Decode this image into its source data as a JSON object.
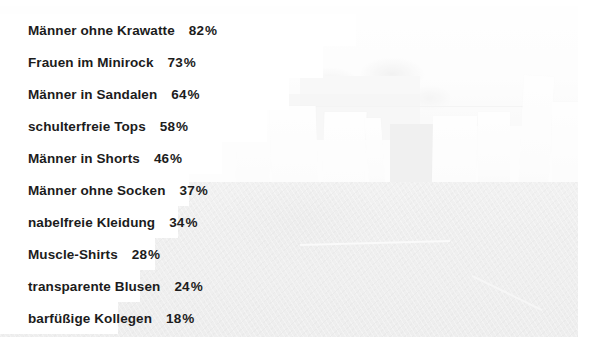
{
  "chart_data": {
    "type": "bar",
    "orientation": "horizontal",
    "title": "",
    "subtitle": "",
    "xlabel": "",
    "ylabel": "",
    "xlim": [
      0,
      100
    ],
    "grid": false,
    "legend": null,
    "value_suffix": "%",
    "categories": [
      "Männer ohne Krawatte",
      "Frauen im Minirock",
      "Männer in Sandalen",
      "schulterfreie Tops",
      "Männer in Shorts",
      "Männer ohne Socken",
      "nabelfreie Kleidung",
      "Muscle-Shirts",
      "transparente Blusen",
      "barfüßige Kollegen"
    ],
    "values": [
      82,
      73,
      64,
      58,
      46,
      37,
      34,
      28,
      24,
      18
    ]
  },
  "colors": {
    "bar": "#ffffff",
    "text": "#1c1c1c",
    "page_background": "#ffffff",
    "photo_tone": "#d9d9d9"
  },
  "rows": [
    {
      "label": "Männer ohne Krawatte",
      "value": "82",
      "pct": "%"
    },
    {
      "label": "Frauen im Minirock",
      "value": "73",
      "pct": "%"
    },
    {
      "label": "Männer in Sandalen",
      "value": "64",
      "pct": "%"
    },
    {
      "label": "schulterfreie Tops",
      "value": "58",
      "pct": "%"
    },
    {
      "label": "Männer in Shorts",
      "value": "46",
      "pct": "%"
    },
    {
      "label": "Männer ohne Socken",
      "value": "37",
      "pct": "%"
    },
    {
      "label": "nabelfreie Kleidung",
      "value": "34",
      "pct": "%"
    },
    {
      "label": "Muscle-Shirts",
      "value": "28",
      "pct": "%"
    },
    {
      "label": "transparente Blusen",
      "value": "24",
      "pct": "%"
    },
    {
      "label": "barfüßige Kollegen",
      "value": "18",
      "pct": "%"
    }
  ]
}
